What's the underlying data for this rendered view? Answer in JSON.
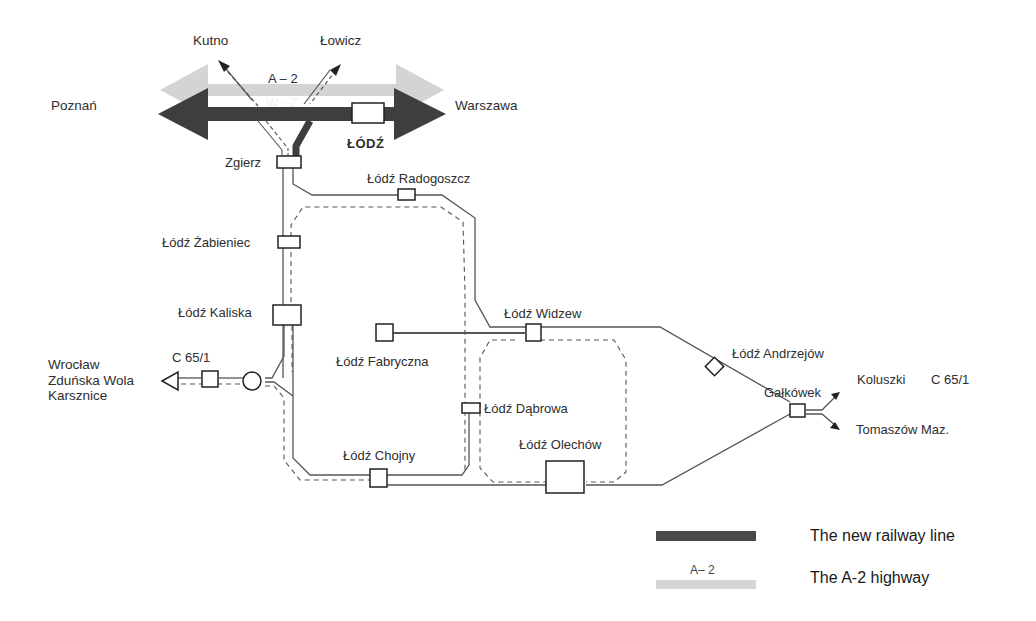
{
  "diagram": {
    "type": "railway-network-schematic",
    "colors": {
      "new_railway": "#3e3e3e",
      "highway": "#d0d0d0",
      "track": "#555555",
      "background": "#ffffff"
    },
    "top_labels": {
      "poznan": "Poznań",
      "warszawa": "Warszawa",
      "kutno": "Kutno",
      "lowicz": "Łowicz",
      "a2": "A – 2",
      "wz": "W - Z",
      "lodz": "ŁÓDŹ"
    },
    "stations": [
      {
        "id": "zgierz",
        "label": "Zgierz"
      },
      {
        "id": "radogoszcz",
        "label": "Łódź Radogoszcz"
      },
      {
        "id": "zabieniec",
        "label": "Łódź Żabieniec"
      },
      {
        "id": "kaliska",
        "label": "Łódź Kaliska"
      },
      {
        "id": "widzew",
        "label": "Łódź Widzew"
      },
      {
        "id": "fabryczna",
        "label": "Łódź Fabryczna"
      },
      {
        "id": "dabrowa",
        "label": "Łódź Dąbrowa"
      },
      {
        "id": "chojny",
        "label": "Łódź Chojny"
      },
      {
        "id": "olechow",
        "label": "Łódź Olechów"
      },
      {
        "id": "andrzejow",
        "label": "Łódź Andrzejów"
      },
      {
        "id": "galkowek",
        "label": "Gałkówek"
      }
    ],
    "west_exit": {
      "line": "C 65/1",
      "destinations": [
        "Wrocław",
        "Zduńska Wola",
        "Karsznice"
      ]
    },
    "east_exit": {
      "koluszki": "Koluszki",
      "koluszki_line": "C 65/1",
      "tomaszow": "Tomaszów Maz."
    }
  },
  "legend": {
    "items": [
      {
        "label": "The new railway line",
        "color": "#4a4a4a"
      },
      {
        "label": "The A-2 highway",
        "color": "#d6d6d6",
        "swatch_text": "A– 2"
      }
    ]
  }
}
